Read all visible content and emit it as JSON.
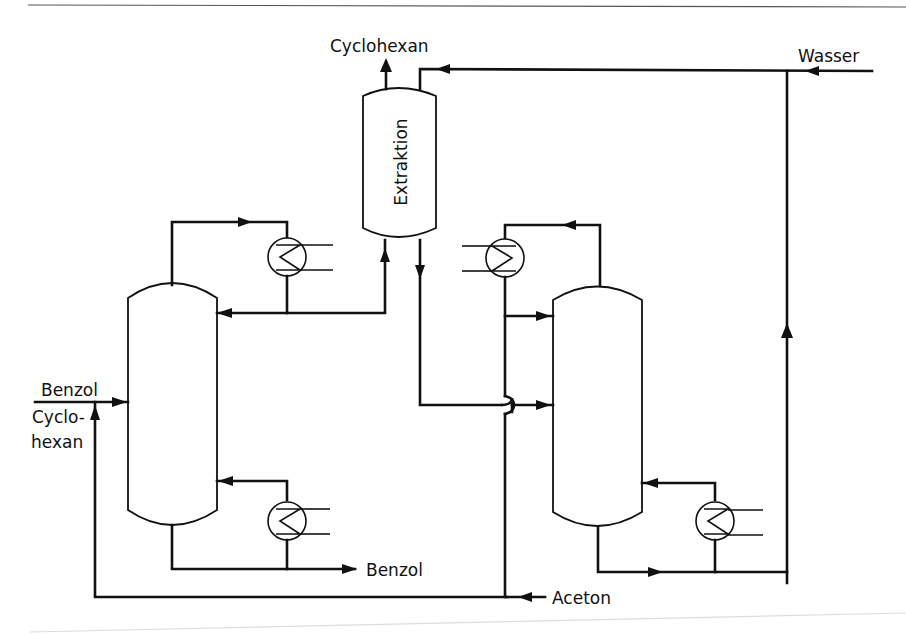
{
  "diagram": {
    "type": "process-flow",
    "units": {
      "extraction": {
        "label": "Extraktion"
      },
      "column_left": {
        "label": ""
      },
      "column_right": {
        "label": ""
      }
    },
    "streams": {
      "cyclohexan_out": "Cyclohexan",
      "wasser_in": "Wasser",
      "benzol_feed_line1": "Benzol",
      "benzol_feed_line2": "Cyclo-",
      "benzol_feed_line3": "hexan",
      "benzol_out": "Benzol",
      "aceton_in": "Aceton"
    },
    "colors": {
      "ink": "#111111",
      "background": "#ffffff"
    }
  }
}
